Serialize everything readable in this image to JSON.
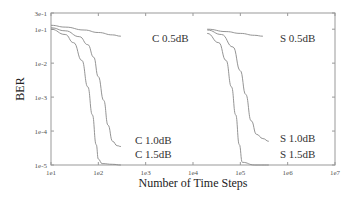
{
  "chart_data": {
    "type": "line",
    "title": "",
    "xlabel": "Number of Time Steps",
    "ylabel": "BER",
    "xscale": "log",
    "yscale": "log",
    "xlim": [
      10,
      10000000
    ],
    "ylim": [
      1e-05,
      0.3
    ],
    "x_tick_labels": [
      "1e1",
      "1e2",
      "1e3",
      "1e4",
      "1e5",
      "1e6",
      "1e7"
    ],
    "y_tick_labels": [
      "3e-1",
      "1e-1",
      "1e-2",
      "1e-3",
      "1e-4",
      "1e-5"
    ],
    "grid": false,
    "legend": "inline labels at curve ends",
    "series": [
      {
        "name": "C 0.5dB",
        "x": [
          10,
          20,
          50,
          100,
          200,
          300
        ],
        "y": [
          0.13,
          0.115,
          0.095,
          0.08,
          0.068,
          0.062
        ]
      },
      {
        "name": "C 1.0dB",
        "x": [
          10,
          20,
          40,
          60,
          80,
          100,
          130,
          160,
          200,
          250,
          300
        ],
        "y": [
          0.11,
          0.09,
          0.06,
          0.035,
          0.015,
          0.004,
          0.0008,
          0.00015,
          5e-05,
          3.7e-05,
          3.5e-05
        ]
      },
      {
        "name": "C 1.5dB",
        "x": [
          10,
          20,
          30,
          45,
          60,
          75,
          90,
          100,
          120,
          200,
          300
        ],
        "y": [
          0.1,
          0.07,
          0.04,
          0.012,
          0.002,
          0.0003,
          4e-05,
          1.5e-05,
          1.1e-05,
          1.05e-05,
          1e-05
        ]
      },
      {
        "name": "S 0.5dB",
        "x": [
          20000,
          50000,
          100000,
          200000,
          300000
        ],
        "y": [
          0.1,
          0.085,
          0.075,
          0.066,
          0.062
        ]
      },
      {
        "name": "S 1.0dB",
        "x": [
          20000,
          40000,
          70000,
          100000,
          130000,
          170000,
          220000,
          300000,
          400000
        ],
        "y": [
          0.095,
          0.07,
          0.03,
          0.006,
          0.0012,
          0.0002,
          8e-05,
          6e-05,
          5e-05
        ]
      },
      {
        "name": "S 1.5dB",
        "x": [
          20000,
          35000,
          50000,
          65000,
          80000,
          95000,
          110000,
          200000,
          400000
        ],
        "y": [
          0.075,
          0.04,
          0.012,
          0.002,
          0.0003,
          4e-05,
          1.2e-05,
          1e-05,
          1e-05
        ]
      }
    ],
    "labels": [
      {
        "text": "C 0.5dB",
        "x_px": 152,
        "y_px": 42
      },
      {
        "text": "C 1.0dB",
        "x_px": 135,
        "y_px": 144
      },
      {
        "text": "C 1.5dB",
        "x_px": 135,
        "y_px": 158
      },
      {
        "text": "S 0.5dB",
        "x_px": 280,
        "y_px": 42
      },
      {
        "text": "S 1.0dB",
        "x_px": 280,
        "y_px": 142
      },
      {
        "text": "S 1.5dB",
        "x_px": 280,
        "y_px": 158
      }
    ]
  },
  "layout": {
    "plot": {
      "left": 51,
      "right": 335,
      "top": 13,
      "bottom": 165
    },
    "line_color": "#888888",
    "axis_color": "#999999"
  }
}
